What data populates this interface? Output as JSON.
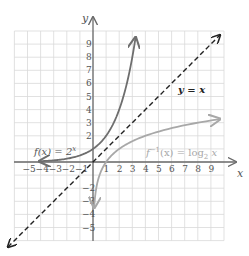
{
  "chart_data": {
    "type": "line",
    "title": "",
    "xlabel": "x",
    "ylabel": "y",
    "xlim": [
      -6,
      10
    ],
    "ylim": [
      -6,
      10
    ],
    "grid": true,
    "x_ticks": [
      -5,
      -4,
      -3,
      -2,
      -1,
      1,
      2,
      3,
      4,
      5,
      6,
      7,
      8,
      9
    ],
    "y_ticks": [
      -5,
      -4,
      -3,
      -2,
      2,
      3,
      4,
      5,
      6,
      7,
      8,
      9
    ],
    "x_tick_labels": [
      "−5",
      "−4",
      "−3",
      "−2",
      "−1",
      "1",
      "2",
      "3",
      "4",
      "5",
      "6",
      "7",
      "8",
      "9"
    ],
    "y_tick_labels": [
      "−5",
      "−4",
      "−3",
      "−2",
      "2",
      "3",
      "4",
      "5",
      "6",
      "7",
      "8",
      "9"
    ],
    "series": [
      {
        "name": "f(x) = 2^x",
        "label_parts": {
          "main": "f(x) = 2",
          "sup": "x"
        },
        "color": "#6e6e6e",
        "style": "solid",
        "x": [
          -4,
          -3,
          -2,
          -1,
          0,
          1,
          2,
          3,
          3.25
        ],
        "y": [
          0.0625,
          0.125,
          0.25,
          0.5,
          1,
          2,
          4,
          8,
          9.5
        ]
      },
      {
        "name": "f^-1(x) = log_2 x",
        "label_parts": {
          "main": "f",
          "sup": "−1",
          "mid": "(x) = log",
          "sub": "2",
          "tail": " x"
        },
        "color": "#a8a8a8",
        "style": "solid",
        "x": [
          0.09,
          0.125,
          0.25,
          0.5,
          1,
          2,
          4,
          8,
          9.7
        ],
        "y": [
          -3.5,
          -3,
          -2,
          -1,
          0,
          1,
          2,
          3,
          3.28
        ]
      },
      {
        "name": "y = x",
        "label_parts": {
          "main": "y = x"
        },
        "color": "#222222",
        "style": "dashed",
        "x": [
          -6.5,
          9.7
        ],
        "y": [
          -6.5,
          9.7
        ]
      }
    ],
    "annotations": [
      {
        "text": "f(x) = 2^x",
        "x": -4.3,
        "y": 0.6
      },
      {
        "text": "f^-1(x) = log_2 x",
        "x": 4.2,
        "y": 0.6
      },
      {
        "text": "y = x",
        "x": 6.6,
        "y": 5.3
      }
    ]
  },
  "axes": {
    "x_label": "x",
    "y_label": "y"
  },
  "labels": {
    "f_main": "f(x) = 2",
    "f_sup": "x",
    "inv_f": "f",
    "inv_sup": "−1",
    "inv_mid": "(x) = log",
    "inv_sub": "2",
    "inv_tail": " x",
    "identity": "y = x"
  },
  "ticks": {
    "x": [
      {
        "v": -5,
        "t": "−5"
      },
      {
        "v": -4,
        "t": "−4"
      },
      {
        "v": -3,
        "t": "−3"
      },
      {
        "v": -2,
        "t": "−2"
      },
      {
        "v": -1,
        "t": "−1"
      },
      {
        "v": 1,
        "t": "1"
      },
      {
        "v": 2,
        "t": "2"
      },
      {
        "v": 3,
        "t": "3"
      },
      {
        "v": 4,
        "t": "4"
      },
      {
        "v": 5,
        "t": "5"
      },
      {
        "v": 6,
        "t": "6"
      },
      {
        "v": 7,
        "t": "7"
      },
      {
        "v": 8,
        "t": "8"
      },
      {
        "v": 9,
        "t": "9"
      }
    ],
    "y": [
      {
        "v": 9,
        "t": "9"
      },
      {
        "v": 8,
        "t": "8"
      },
      {
        "v": 7,
        "t": "7"
      },
      {
        "v": 6,
        "t": "6"
      },
      {
        "v": 5,
        "t": "5"
      },
      {
        "v": 4,
        "t": "4"
      },
      {
        "v": 3,
        "t": "3"
      },
      {
        "v": 2,
        "t": "2"
      },
      {
        "v": -2,
        "t": "−2"
      },
      {
        "v": -3,
        "t": "−3"
      },
      {
        "v": -4,
        "t": "−4"
      },
      {
        "v": -5,
        "t": "−5"
      }
    ]
  },
  "colors": {
    "grid": "#d9d9d9",
    "axis": "#6a6a6a",
    "exp_curve": "#6e6e6e",
    "log_curve": "#a8a8a8",
    "identity_line": "#222222"
  }
}
